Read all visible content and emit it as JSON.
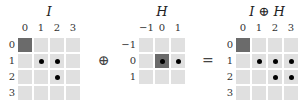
{
  "diagram": {
    "operator": "⊕",
    "equals": "=",
    "grids": [
      {
        "id": "I",
        "title": "I",
        "col_labels": [
          "0",
          "1",
          "2",
          "3"
        ],
        "row_labels": [
          "0",
          "1",
          "2",
          "3"
        ],
        "origin_cell": [
          0,
          0
        ],
        "dots": [
          [
            1,
            1
          ],
          [
            1,
            2
          ],
          [
            2,
            2
          ]
        ]
      },
      {
        "id": "H",
        "title": "H",
        "col_labels": [
          "−1",
          "0",
          "1"
        ],
        "row_labels": [
          "−1",
          "0",
          "1"
        ],
        "origin_cell": [
          1,
          1
        ],
        "dots": [
          [
            1,
            1
          ],
          [
            1,
            2
          ]
        ]
      },
      {
        "id": "I_dilate_H",
        "title": "I ⊕ H",
        "col_labels": [
          "0",
          "1",
          "2",
          "3"
        ],
        "row_labels": [
          "0",
          "1",
          "2",
          "3"
        ],
        "origin_cell": [
          0,
          0
        ],
        "dots": [
          [
            1,
            1
          ],
          [
            1,
            2
          ],
          [
            1,
            3
          ],
          [
            2,
            2
          ],
          [
            2,
            3
          ]
        ]
      }
    ]
  }
}
